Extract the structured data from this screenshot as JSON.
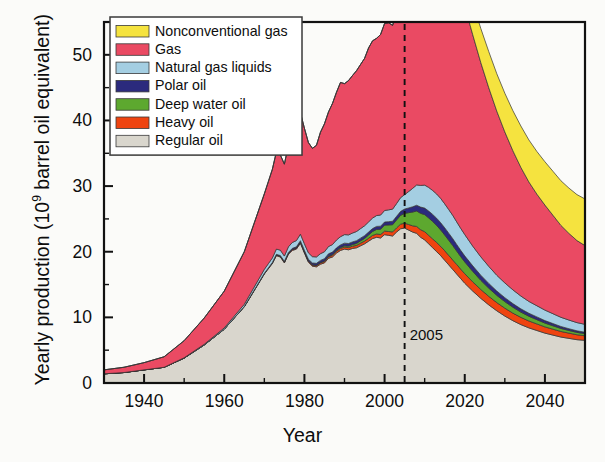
{
  "chart_data": {
    "type": "area",
    "title": "",
    "xlabel": "Year",
    "ylabel": "Yearly production (10⁹ barrel oil equivalent)",
    "ylabel_prefix": "Yearly production (10",
    "ylabel_exponent": "9",
    "ylabel_suffix": " barrel oil equivalent)",
    "stacked": true,
    "grid": false,
    "xlim": [
      1930,
      2050
    ],
    "ylim": [
      0,
      55
    ],
    "xticks": [
      1940,
      1960,
      1980,
      2000,
      2020,
      2040
    ],
    "xtick_labels": [
      "1940",
      "1960",
      "1980",
      "2000",
      "2020",
      "2040"
    ],
    "xminor_step": 10,
    "yticks": [
      0,
      10,
      20,
      30,
      40,
      50
    ],
    "ytick_labels": [
      "0",
      "10",
      "20",
      "30",
      "40",
      "50"
    ],
    "yminor_step": 5,
    "legend_position": "top-left",
    "annotations": [
      {
        "name": "marker-2005",
        "label": "2005",
        "x": 2005,
        "style": "dashed-vertical-line"
      }
    ],
    "colors": {
      "nonconventional_gas": "#f5e33f",
      "gas": "#ea4a63",
      "natural_gas_liquids": "#a4cee2",
      "polar_oil": "#2b2a7d",
      "deep_water_oil": "#5da82f",
      "heavy_oil": "#ef4410",
      "regular_oil": "#d9d6cd",
      "outline": "#333333",
      "axis": "#111111",
      "background": "#fbfbf9"
    },
    "x": [
      1930,
      1935,
      1940,
      1945,
      1950,
      1955,
      1960,
      1965,
      1970,
      1971,
      1972,
      1973,
      1974,
      1975,
      1976,
      1977,
      1978,
      1979,
      1980,
      1981,
      1982,
      1983,
      1984,
      1985,
      1986,
      1987,
      1988,
      1989,
      1990,
      1991,
      1992,
      1993,
      1994,
      1995,
      1996,
      1997,
      1998,
      1999,
      2000,
      2001,
      2002,
      2003,
      2004,
      2005,
      2006,
      2007,
      2008,
      2009,
      2010,
      2011,
      2012,
      2013,
      2014,
      2015,
      2016,
      2017,
      2018,
      2019,
      2020,
      2022,
      2024,
      2026,
      2028,
      2030,
      2032,
      2034,
      2036,
      2038,
      2040,
      2042,
      2044,
      2046,
      2048,
      2050
    ],
    "series": [
      {
        "name": "Regular oil",
        "key": "regular_oil",
        "color": "#d9d6cd",
        "values": [
          1.4,
          1.6,
          2.0,
          2.4,
          3.8,
          5.8,
          8.2,
          11.6,
          16.6,
          17.4,
          18.2,
          19.4,
          19.2,
          18.3,
          19.6,
          20.2,
          20.4,
          21.3,
          19.8,
          18.4,
          17.8,
          17.7,
          18.1,
          18.3,
          19.0,
          19.2,
          19.8,
          20.2,
          20.4,
          20.3,
          20.5,
          20.6,
          20.9,
          21.2,
          21.6,
          22.0,
          22.2,
          22.1,
          22.6,
          22.5,
          22.4,
          23.0,
          23.5,
          23.6,
          23.3,
          23.0,
          22.8,
          22.2,
          21.8,
          21.2,
          20.6,
          20.0,
          19.4,
          18.7,
          18.0,
          17.3,
          16.6,
          15.9,
          15.2,
          14.0,
          12.9,
          11.9,
          11.0,
          10.2,
          9.5,
          8.9,
          8.4,
          8.0,
          7.6,
          7.3,
          7.0,
          6.8,
          6.6,
          6.5
        ]
      },
      {
        "name": "Heavy oil",
        "key": "heavy_oil",
        "color": "#ef4410",
        "values": [
          0,
          0,
          0,
          0,
          0,
          0,
          0,
          0.05,
          0.1,
          0.1,
          0.1,
          0.12,
          0.12,
          0.12,
          0.14,
          0.14,
          0.15,
          0.16,
          0.16,
          0.16,
          0.17,
          0.18,
          0.2,
          0.22,
          0.24,
          0.26,
          0.28,
          0.3,
          0.32,
          0.33,
          0.35,
          0.37,
          0.4,
          0.42,
          0.45,
          0.48,
          0.5,
          0.52,
          0.55,
          0.58,
          0.62,
          0.65,
          0.7,
          0.75,
          0.85,
          0.95,
          1.05,
          1.15,
          1.25,
          1.3,
          1.35,
          1.4,
          1.42,
          1.45,
          1.45,
          1.45,
          1.45,
          1.45,
          1.45,
          1.4,
          1.35,
          1.3,
          1.25,
          1.2,
          1.15,
          1.1,
          1.05,
          1.0,
          0.95,
          0.9,
          0.85,
          0.8,
          0.75,
          0.7
        ]
      },
      {
        "name": "Deep water oil",
        "key": "deep_water_oil",
        "color": "#5da82f",
        "values": [
          0,
          0,
          0,
          0,
          0,
          0,
          0,
          0,
          0,
          0,
          0,
          0,
          0,
          0,
          0,
          0,
          0,
          0,
          0.02,
          0.03,
          0.04,
          0.05,
          0.06,
          0.08,
          0.1,
          0.12,
          0.14,
          0.16,
          0.2,
          0.22,
          0.25,
          0.3,
          0.35,
          0.4,
          0.5,
          0.6,
          0.7,
          0.8,
          0.9,
          1.0,
          1.1,
          1.2,
          1.35,
          1.5,
          1.8,
          2.1,
          2.35,
          2.5,
          2.6,
          2.65,
          2.65,
          2.6,
          2.5,
          2.4,
          2.3,
          2.2,
          2.05,
          1.9,
          1.8,
          1.6,
          1.4,
          1.25,
          1.1,
          1.0,
          0.9,
          0.8,
          0.72,
          0.65,
          0.58,
          0.52,
          0.46,
          0.4,
          0.36,
          0.32
        ]
      },
      {
        "name": "Polar oil",
        "key": "polar_oil",
        "color": "#2b2a7d",
        "values": [
          0,
          0,
          0,
          0,
          0,
          0,
          0,
          0,
          0.02,
          0.03,
          0.05,
          0.08,
          0.1,
          0.12,
          0.15,
          0.18,
          0.2,
          0.22,
          0.24,
          0.26,
          0.28,
          0.3,
          0.32,
          0.34,
          0.35,
          0.36,
          0.37,
          0.38,
          0.39,
          0.4,
          0.4,
          0.41,
          0.42,
          0.43,
          0.44,
          0.45,
          0.46,
          0.47,
          0.48,
          0.5,
          0.52,
          0.55,
          0.6,
          0.65,
          0.72,
          0.8,
          0.88,
          0.95,
          1.0,
          1.05,
          1.08,
          1.1,
          1.1,
          1.1,
          1.08,
          1.05,
          1.0,
          0.96,
          0.92,
          0.85,
          0.78,
          0.72,
          0.66,
          0.6,
          0.55,
          0.5,
          0.46,
          0.42,
          0.38,
          0.34,
          0.3,
          0.27,
          0.24,
          0.22
        ]
      },
      {
        "name": "Natural gas liquids",
        "key": "natural_gas_liquids",
        "color": "#a4cee2",
        "values": [
          0,
          0,
          0,
          0,
          0.05,
          0.1,
          0.2,
          0.35,
          0.6,
          0.65,
          0.7,
          0.8,
          0.82,
          0.8,
          0.85,
          0.9,
          0.95,
          1.0,
          1.0,
          0.98,
          0.96,
          0.98,
          1.02,
          1.05,
          1.1,
          1.15,
          1.2,
          1.25,
          1.3,
          1.32,
          1.35,
          1.4,
          1.45,
          1.5,
          1.55,
          1.6,
          1.65,
          1.7,
          1.75,
          1.8,
          1.85,
          1.95,
          2.1,
          2.2,
          2.5,
          2.8,
          3.1,
          3.3,
          3.5,
          3.6,
          3.65,
          3.7,
          3.7,
          3.65,
          3.6,
          3.55,
          3.45,
          3.35,
          3.25,
          3.0,
          2.8,
          2.6,
          2.4,
          2.25,
          2.1,
          1.95,
          1.8,
          1.7,
          1.6,
          1.5,
          1.4,
          1.32,
          1.25,
          1.2
        ]
      },
      {
        "name": "Gas",
        "key": "gas",
        "color": "#ea4a63",
        "values": [
          0.6,
          0.8,
          1.1,
          1.6,
          2.6,
          4.0,
          5.6,
          8.0,
          11.5,
          12.5,
          13.5,
          14.8,
          14.5,
          14.0,
          15.5,
          16.5,
          17.2,
          18.5,
          17.6,
          16.8,
          16.5,
          17.0,
          18.5,
          19.5,
          20.5,
          21.5,
          22.5,
          23.5,
          23.0,
          23.5,
          24.0,
          24.5,
          25.0,
          25.5,
          26.5,
          27.0,
          27.0,
          27.5,
          28.5,
          28.5,
          28.0,
          29.0,
          30.0,
          30.5,
          32.0,
          33.5,
          35.0,
          36.5,
          37.8,
          38.8,
          39.5,
          40.0,
          40.2,
          39.8,
          39.0,
          38.0,
          37.0,
          36.0,
          34.8,
          32.2,
          29.6,
          27.2,
          25.0,
          23.0,
          21.2,
          19.6,
          18.2,
          17.0,
          16.0,
          15.0,
          14.0,
          13.2,
          12.5,
          12.0
        ]
      },
      {
        "name": "Nonconventional gas",
        "key": "nonconventional_gas",
        "color": "#f5e33f",
        "values": [
          0,
          0,
          0,
          0,
          0,
          0,
          0,
          0,
          0,
          0,
          0,
          0,
          0,
          0,
          0,
          0,
          0,
          0,
          0,
          0,
          0,
          0,
          0,
          0,
          0,
          0,
          0,
          0,
          0,
          0,
          0,
          0,
          0,
          0,
          0,
          0,
          0,
          0,
          0,
          0,
          0,
          0.1,
          0.3,
          0.5,
          0.8,
          1.1,
          1.4,
          1.7,
          2.0,
          2.3,
          2.6,
          2.9,
          3.2,
          3.5,
          3.8,
          4.0,
          4.2,
          4.4,
          4.6,
          4.9,
          5.2,
          5.5,
          5.7,
          5.9,
          6.1,
          6.3,
          6.4,
          6.5,
          6.6,
          6.7,
          6.8,
          6.9,
          7.0,
          7.1
        ]
      }
    ]
  },
  "legend": {
    "items": [
      {
        "label": "Nonconventional gas",
        "color": "#f5e33f"
      },
      {
        "label": "Gas",
        "color": "#ea4a63"
      },
      {
        "label": "Natural gas liquids",
        "color": "#a4cee2"
      },
      {
        "label": "Polar oil",
        "color": "#2b2a7d"
      },
      {
        "label": "Deep water oil",
        "color": "#5da82f"
      },
      {
        "label": "Heavy oil",
        "color": "#ef4410"
      },
      {
        "label": "Regular oil",
        "color": "#d9d6cd"
      }
    ]
  }
}
